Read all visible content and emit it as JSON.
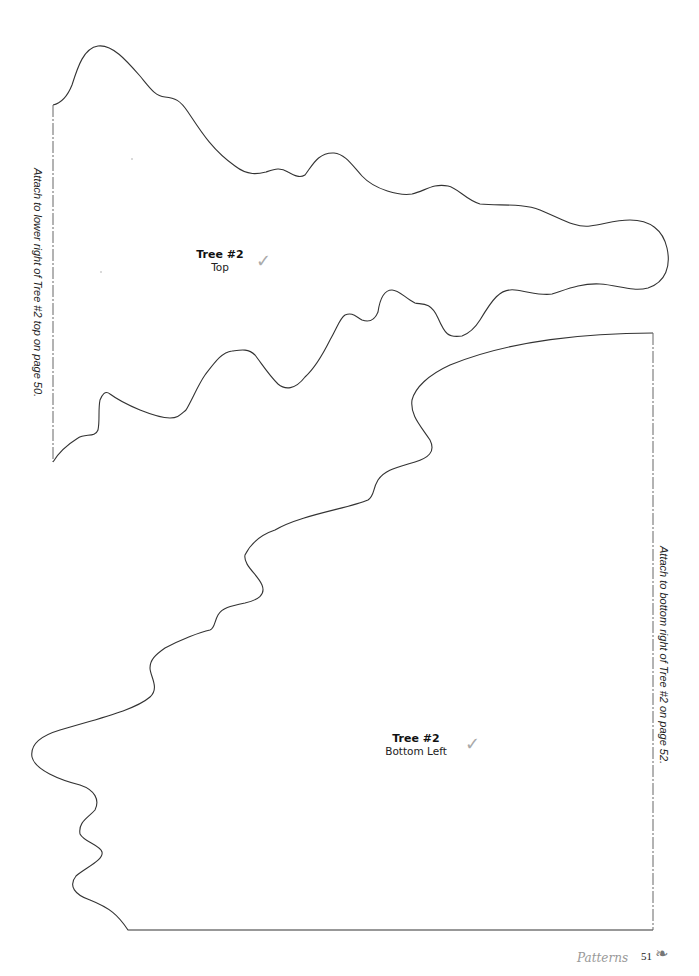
{
  "pattern_pieces": [
    {
      "title": "Tree #2",
      "subtitle": "Top",
      "check_mark": "✓",
      "attach_note": "Attach to lower right of Tree #2 top on page 50."
    },
    {
      "title": "Tree #2",
      "subtitle": "Bottom Left",
      "check_mark": "✓",
      "attach_note": "Attach to bottom right of Tree #2 on page 52."
    }
  ],
  "footer": {
    "section": "Patterns",
    "page_number": "51",
    "ornament_icon": "leaf-icon",
    "ornament_glyph": "❧"
  },
  "colors": {
    "outline": "#333333",
    "dash_line": "#666666",
    "check": "#aaaaaa",
    "footer_section": "#999999"
  }
}
